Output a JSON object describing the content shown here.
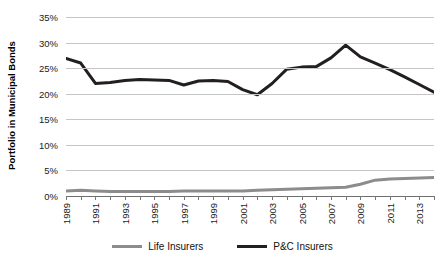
{
  "chart_data": {
    "type": "line",
    "title": "",
    "xlabel": "",
    "ylabel": "Portfolio in Municipal Bonds",
    "ylim": [
      0,
      35
    ],
    "ytick_labels": [
      "35%",
      "30%",
      "25%",
      "20%",
      "15%",
      "10%",
      "5%",
      "0%"
    ],
    "ytick_values": [
      35,
      30,
      25,
      20,
      15,
      10,
      5,
      0
    ],
    "grid": true,
    "legend_position": "bottom",
    "x": [
      1989,
      1990,
      1991,
      1992,
      1993,
      1994,
      1995,
      1996,
      1997,
      1998,
      1999,
      2000,
      2001,
      2002,
      2003,
      2004,
      2005,
      2006,
      2007,
      2008,
      2009,
      2010,
      2011,
      2012,
      2013,
      2014
    ],
    "xtick_labels": [
      "1989",
      "1991",
      "1993",
      "1995",
      "1997",
      "1999",
      "2001",
      "2003",
      "2005",
      "2007",
      "2009",
      "2011",
      "2013"
    ],
    "xtick_values": [
      1989,
      1991,
      1993,
      1995,
      1997,
      1999,
      2001,
      2003,
      2005,
      2007,
      2009,
      2011,
      2013
    ],
    "series": [
      {
        "name": "Life Insurers",
        "color": "#8c8c8c",
        "values": [
          1.0,
          1.1,
          1.0,
          0.9,
          0.9,
          0.9,
          0.9,
          0.9,
          1.0,
          1.0,
          1.0,
          1.0,
          1.0,
          1.1,
          1.2,
          1.3,
          1.4,
          1.5,
          1.6,
          1.7,
          2.3,
          3.1,
          3.3,
          3.4,
          3.5,
          3.6
        ]
      },
      {
        "name": "P&C Insurers",
        "color": "#231f20",
        "values": [
          26.9,
          26.0,
          22.0,
          22.2,
          22.6,
          22.8,
          22.7,
          22.6,
          21.7,
          22.5,
          22.6,
          22.4,
          20.8,
          19.8,
          22.0,
          24.8,
          25.2,
          25.3,
          27.0,
          29.5,
          27.2,
          26.0,
          24.7,
          23.3,
          21.8,
          20.3
        ]
      }
    ]
  },
  "legend": {
    "items": [
      {
        "label": "Life Insurers",
        "color": "#8c8c8c"
      },
      {
        "label": "P&C Insurers",
        "color": "#231f20"
      }
    ]
  }
}
